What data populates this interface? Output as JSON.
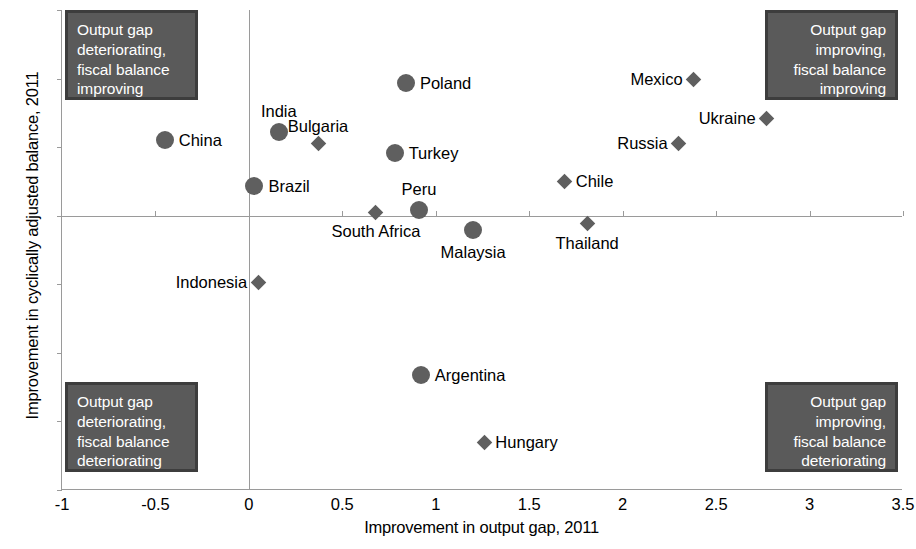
{
  "chart_data": {
    "type": "scatter",
    "title": "",
    "xlabel": "Improvement in output gap, 2011",
    "ylabel": "Improvement in cyclically adjusted balance, 2011",
    "xlim": [
      -1,
      3.5
    ],
    "ylim": [
      -4,
      3
    ],
    "xticks": [
      "-1",
      "-0.5",
      "0",
      "0.5",
      "1",
      "1.5",
      "2",
      "2.5",
      "3",
      "3.5"
    ],
    "xtick_values": [
      -1,
      -0.5,
      0,
      0.5,
      1,
      1.5,
      2,
      2.5,
      3,
      3.5
    ],
    "yticks": [
      "3",
      "2",
      "1",
      "0",
      "-1",
      "-2",
      "-3",
      "-4"
    ],
    "ytick_values": [
      3,
      2,
      1,
      0,
      -1,
      -2,
      -3,
      -4
    ],
    "grid": false,
    "legend": "none",
    "marker_color": "#5f5f5f",
    "points": [
      {
        "name": "China",
        "x": -0.45,
        "y": 1.11,
        "marker": "circle",
        "label_pos": "right"
      },
      {
        "name": "India",
        "x": 0.16,
        "y": 1.22,
        "marker": "circle",
        "label_pos": "above"
      },
      {
        "name": "Brazil",
        "x": 0.03,
        "y": 0.44,
        "marker": "circle",
        "label_pos": "right"
      },
      {
        "name": "Bulgaria",
        "x": 0.37,
        "y": 1.05,
        "marker": "diamond",
        "label_pos": "above"
      },
      {
        "name": "Poland",
        "x": 0.84,
        "y": 1.94,
        "marker": "circle",
        "label_pos": "right"
      },
      {
        "name": "Turkey",
        "x": 0.78,
        "y": 0.92,
        "marker": "circle",
        "label_pos": "right"
      },
      {
        "name": "Peru",
        "x": 0.91,
        "y": 0.09,
        "marker": "circle",
        "label_pos": "above"
      },
      {
        "name": "South Africa",
        "x": 0.68,
        "y": 0.05,
        "marker": "diamond",
        "label_pos": "below"
      },
      {
        "name": "Malaysia",
        "x": 1.2,
        "y": -0.21,
        "marker": "circle",
        "label_pos": "below"
      },
      {
        "name": "Chile",
        "x": 1.69,
        "y": 0.5,
        "marker": "diamond",
        "label_pos": "right"
      },
      {
        "name": "Thailand",
        "x": 1.81,
        "y": -0.12,
        "marker": "diamond",
        "label_pos": "below"
      },
      {
        "name": "Russia",
        "x": 2.3,
        "y": 1.06,
        "marker": "diamond",
        "label_pos": "left"
      },
      {
        "name": "Mexico",
        "x": 2.38,
        "y": 1.99,
        "marker": "diamond",
        "label_pos": "left"
      },
      {
        "name": "Ukraine",
        "x": 2.77,
        "y": 1.42,
        "marker": "diamond",
        "label_pos": "left"
      },
      {
        "name": "Indonesia",
        "x": 0.05,
        "y": -0.97,
        "marker": "diamond",
        "label_pos": "left"
      },
      {
        "name": "Argentina",
        "x": 0.92,
        "y": -2.33,
        "marker": "circle",
        "label_pos": "right"
      },
      {
        "name": "Hungary",
        "x": 1.26,
        "y": -3.3,
        "marker": "diamond",
        "label_pos": "right"
      }
    ],
    "annotations": [
      {
        "id": "top-left",
        "text": "Output gap deteriorating, fiscal balance improving",
        "quadrant": "top-left"
      },
      {
        "id": "top-right",
        "text": "Output gap improving, fiscal balance improving",
        "quadrant": "top-right"
      },
      {
        "id": "bottom-left",
        "text": "Output gap deteriorating, fiscal balance deteriorating",
        "quadrant": "bottom-left"
      },
      {
        "id": "bottom-right",
        "text": "Output gap improving, fiscal balance deteriorating",
        "quadrant": "bottom-right"
      }
    ]
  },
  "annotation_lines": {
    "tl": [
      "Output gap",
      "deteriorating,",
      "fiscal balance",
      "improving"
    ],
    "tr": [
      "Output gap",
      "improving,",
      "fiscal balance",
      "improving"
    ],
    "bl": [
      "Output gap",
      "deteriorating,",
      "fiscal balance",
      "deteriorating"
    ],
    "br": [
      "Output gap",
      "improving,",
      "fiscal balance",
      "deteriorating"
    ]
  }
}
